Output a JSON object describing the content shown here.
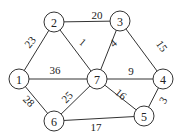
{
  "graph": {
    "nodes": [
      {
        "id": "1",
        "label": "1",
        "x": 19,
        "y": 79
      },
      {
        "id": "2",
        "label": "2",
        "x": 54,
        "y": 22
      },
      {
        "id": "3",
        "label": "3",
        "x": 120,
        "y": 21
      },
      {
        "id": "4",
        "label": "4",
        "x": 163,
        "y": 79
      },
      {
        "id": "5",
        "label": "5",
        "x": 144,
        "y": 116
      },
      {
        "id": "6",
        "label": "6",
        "x": 54,
        "y": 121
      },
      {
        "id": "7",
        "label": "7",
        "x": 97,
        "y": 79
      }
    ],
    "edges": [
      {
        "from": "2",
        "to": "3",
        "weight": "20",
        "lx": 97,
        "ly": 15,
        "rot": 0
      },
      {
        "from": "1",
        "to": "2",
        "weight": "23",
        "lx": 30,
        "ly": 42,
        "rot": -50
      },
      {
        "from": "2",
        "to": "7",
        "weight": "1",
        "lx": 83,
        "ly": 42,
        "rot": 40
      },
      {
        "from": "3",
        "to": "7",
        "weight": "4",
        "lx": 113,
        "ly": 43,
        "rot": -40
      },
      {
        "from": "3",
        "to": "4",
        "weight": "15",
        "lx": 162,
        "ly": 46,
        "rot": 55
      },
      {
        "from": "1",
        "to": "7",
        "weight": "36",
        "lx": 55,
        "ly": 70,
        "rot": 0
      },
      {
        "from": "7",
        "to": "4",
        "weight": "9",
        "lx": 131,
        "ly": 71,
        "rot": 0
      },
      {
        "from": "1",
        "to": "6",
        "weight": "28",
        "lx": 29,
        "ly": 101,
        "rot": 45
      },
      {
        "from": "6",
        "to": "7",
        "weight": "25",
        "lx": 67,
        "ly": 97,
        "rot": -45
      },
      {
        "from": "7",
        "to": "5",
        "weight": "16",
        "lx": 121,
        "ly": 94,
        "rot": 40
      },
      {
        "from": "4",
        "to": "5",
        "weight": "3",
        "lx": 163,
        "ly": 100,
        "rot": -60
      },
      {
        "from": "6",
        "to": "5",
        "weight": "17",
        "lx": 96,
        "ly": 127,
        "rot": 0
      }
    ]
  }
}
